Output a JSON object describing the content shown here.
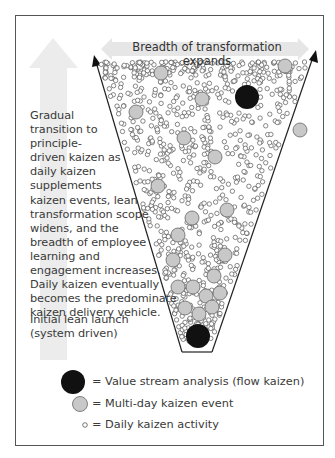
{
  "banner": {
    "label": "Breadth of transformation expands"
  },
  "description": {
    "lines": [
      "Gradual",
      "transition to",
      "principle-",
      "driven kaizen as",
      "daily kaizen",
      "supplements",
      "kaizen events, lean",
      "transformation scope",
      "widens, and the",
      "breadth of employee",
      "learning and",
      "engagement increases.",
      "Daily kaizen eventually",
      "becomes the predominate",
      "kaizen delivery vehicle."
    ]
  },
  "launch": {
    "lines": [
      "Initial lean launch",
      "(system driven)"
    ]
  },
  "legend": {
    "items": [
      {
        "symbol": "large-black-circle",
        "label": "= Value stream analysis (flow kaizen)"
      },
      {
        "symbol": "gray-circle",
        "label": "= Multi-day kaizen event"
      },
      {
        "symbol": "small-open-circle",
        "label": "= Daily kaizen activity"
      }
    ]
  },
  "colors": {
    "black_circle": "#111111",
    "gray_circle": "#c8c8c8",
    "arrow_bg": "#ececec",
    "line": "#222222"
  }
}
